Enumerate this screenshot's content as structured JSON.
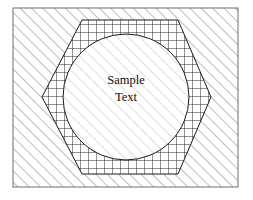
{
  "figure": {
    "background_color": "#ffffff",
    "stroke_color": "#1a1a1a",
    "canvas": {
      "width": 253,
      "height": 200
    }
  },
  "frame": {
    "name": "outer-rectangle",
    "x": 13,
    "y": 8,
    "width": 225,
    "height": 179,
    "fill_pattern": "diagonal-hatch-up",
    "fill_color": "#8c8c8c",
    "stroke_color": "#6e6e6e",
    "stroke_width": 1
  },
  "hexagon": {
    "name": "hexagon",
    "points": "82,20 178,20 211,97 178,174 82,174 42,97",
    "fill_pattern": "square-grid",
    "fill_color": "#1a1a1a",
    "stroke_color": "#1a1a1a",
    "stroke_width": 1,
    "grid_spacing": 8
  },
  "circle": {
    "name": "circle",
    "cx": 126,
    "cy": 97,
    "r": 63,
    "fill_pattern": "diagonal-hatch-light",
    "fill_color": "#b8b8b8",
    "stroke_color": "#1a1a1a",
    "stroke_width": 1
  },
  "label": {
    "name": "sample-text-label",
    "lines": [
      "Sample",
      "Text"
    ],
    "line1": "Sample",
    "line2": "Text",
    "x": 126,
    "y1": 84,
    "y2": 101,
    "font_size": 12.5,
    "color": "#111111"
  }
}
